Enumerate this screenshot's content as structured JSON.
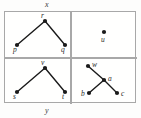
{
  "figure": {
    "top_axis_label": "x",
    "bottom_axis_label": "y",
    "colors": {
      "frame": "#a8a8a8",
      "node": "#1a1a1a",
      "edge": "#1a1a1a",
      "background": "#fdfdfc",
      "label": "#2a2a2a"
    }
  },
  "panels": [
    {
      "id": "top-left",
      "nodes": [
        {
          "label": "r",
          "cx": 40,
          "cy": 9,
          "lx": 36,
          "ly": 0
        },
        {
          "label": "p",
          "cx": 12,
          "cy": 33,
          "lx": 8,
          "ly": 34
        },
        {
          "label": "q",
          "cx": 60,
          "cy": 33,
          "lx": 56,
          "ly": 34
        }
      ],
      "edges": [
        {
          "from": "r",
          "to": "p"
        },
        {
          "from": "r",
          "to": "q"
        }
      ]
    },
    {
      "id": "top-right",
      "nodes": [
        {
          "label": "u",
          "cx": 33,
          "cy": 20,
          "lx": 30,
          "ly": 24
        }
      ],
      "edges": []
    },
    {
      "id": "bottom-left",
      "nodes": [
        {
          "label": "v",
          "cx": 40,
          "cy": 10,
          "lx": 36,
          "ly": 1
        },
        {
          "label": "s",
          "cx": 12,
          "cy": 34,
          "lx": 8,
          "ly": 35
        },
        {
          "label": "t",
          "cx": 60,
          "cy": 34,
          "lx": 57,
          "ly": 35
        }
      ],
      "edges": [
        {
          "from": "v",
          "to": "s"
        },
        {
          "from": "v",
          "to": "t"
        }
      ]
    },
    {
      "id": "bottom-right",
      "nodes": [
        {
          "label": "w",
          "cx": 17,
          "cy": 8,
          "lx": 21,
          "ly": 3
        },
        {
          "label": "a",
          "cx": 33,
          "cy": 22,
          "lx": 37,
          "ly": 17
        },
        {
          "label": "b",
          "cx": 18,
          "cy": 35,
          "lx": 10,
          "ly": 32
        },
        {
          "label": "c",
          "cx": 46,
          "cy": 35,
          "lx": 50,
          "ly": 32
        }
      ],
      "edges": [
        {
          "from": "w",
          "to": "a"
        },
        {
          "from": "a",
          "to": "b"
        },
        {
          "from": "a",
          "to": "c"
        }
      ]
    }
  ]
}
